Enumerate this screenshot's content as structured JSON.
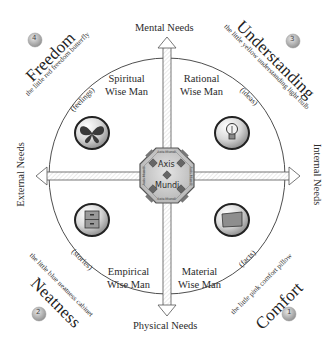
{
  "diagram": {
    "axes": {
      "top": "Mental Needs",
      "bottom": "Physical Needs",
      "left": "External Needs",
      "right": "Internal Needs"
    },
    "center": {
      "line1": "Axis",
      "line2": "Mundi",
      "ring_labels": [
        "Axis Mundi",
        "Axis Mundi",
        "Axis Mundi",
        "Axis Mundi"
      ]
    },
    "quadrants": [
      {
        "position": "top-left",
        "wise_man_line1": "Spiritual",
        "wise_man_line2": "Wise Man",
        "category": "(feelings)",
        "icon": "butterfly-icon",
        "value_number": "4",
        "value_title": "Freedom",
        "value_caption": "the little red freedom butterfly",
        "accent": "#c0392b"
      },
      {
        "position": "top-right",
        "wise_man_line1": "Rational",
        "wise_man_line2": "Wise Man",
        "category": "(ideas)",
        "icon": "lightbulb-icon",
        "value_number": "3",
        "value_title": "Understanding",
        "value_caption": "the little yellow understanding light bulb",
        "accent": "#e1b12c"
      },
      {
        "position": "bottom-left",
        "wise_man_line1": "Empirical",
        "wise_man_line2": "Wise Man",
        "category": "(stories)",
        "icon": "cabinet-icon",
        "value_number": "2",
        "value_title": "Neatness",
        "value_caption": "the little blue neatness cabinet",
        "accent": "#2f6db5"
      },
      {
        "position": "bottom-right",
        "wise_man_line1": "Material",
        "wise_man_line2": "Wise Man",
        "category": "(facts)",
        "icon": "pillow-icon",
        "value_number": "1",
        "value_title": "Comfort",
        "value_caption": "the little pink comfort pillow",
        "accent": "#e87aa0"
      }
    ]
  }
}
